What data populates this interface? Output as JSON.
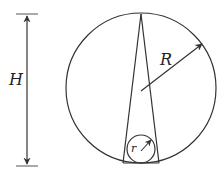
{
  "diagram": {
    "labels": {
      "height": "H",
      "big_radius": "R",
      "small_radius": "r"
    },
    "colors": {
      "stroke": "#333333",
      "background": "#ffffff"
    }
  }
}
